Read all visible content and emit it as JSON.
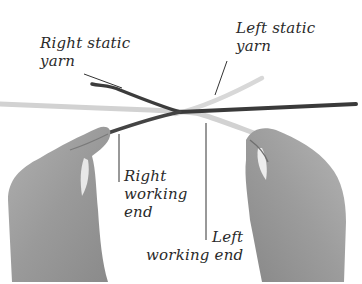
{
  "figure": {
    "colors": {
      "background": "#ffffff",
      "dark_yarn": "#3a3a3a",
      "light_yarn": "#d4d4d4",
      "hand": "#9a9a9a",
      "leader_line": "#333333",
      "label_text": "#2a2a2a"
    }
  },
  "labels": {
    "right_static": {
      "line1": "Right static",
      "line2": "yarn"
    },
    "left_static": {
      "line1": "Left static",
      "line2": "yarn"
    },
    "right_working": {
      "line1": "Right",
      "line2": "working",
      "line3": "end"
    },
    "left_working": {
      "line1": "Left",
      "line2": "working end"
    }
  }
}
